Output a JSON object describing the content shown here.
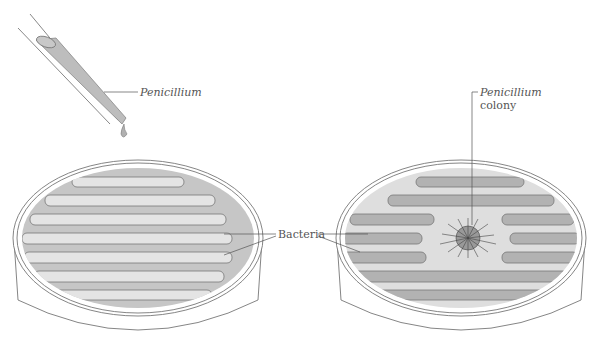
{
  "labels": {
    "dropper": "Penicillium",
    "bacteria": "Bacteria",
    "colony_line1": "Penicillium",
    "colony_line2": "colony"
  },
  "colors": {
    "agar_left": "#c6c6c6",
    "streak_left": "#e4e4e4",
    "agar_right": "#dedede",
    "streak_right": "#b2b2b2",
    "outline": "#777777",
    "dropper_fill": "#bdbdbd"
  }
}
